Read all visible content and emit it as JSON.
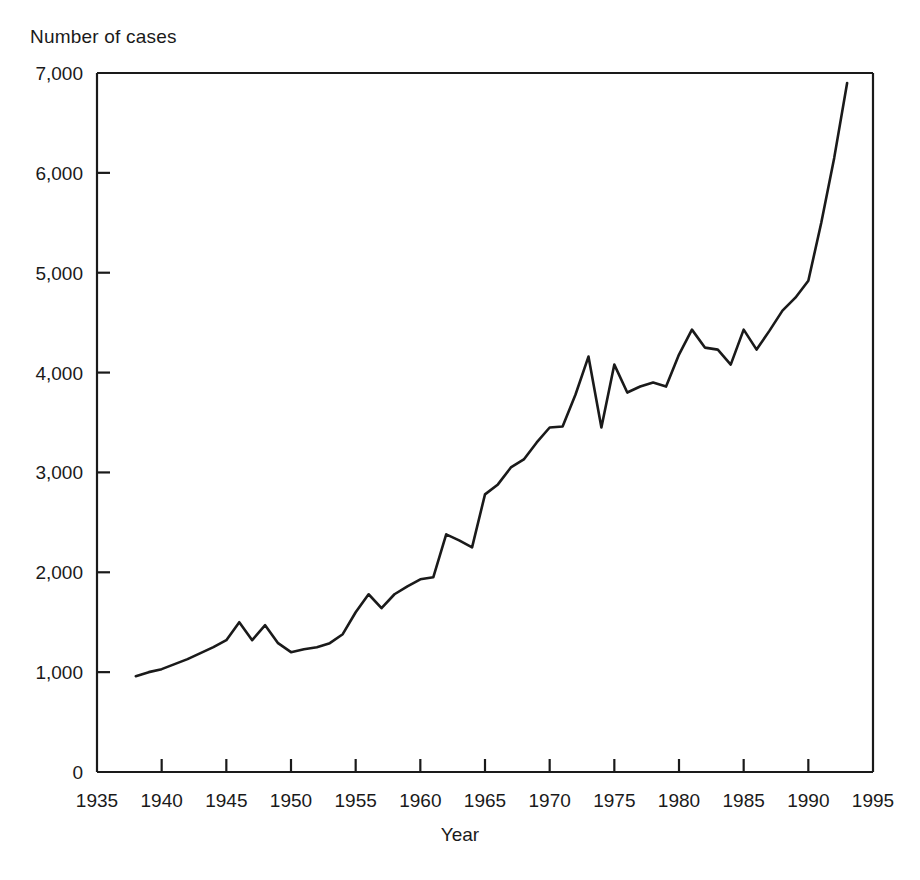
{
  "chart_data": {
    "type": "line",
    "title": "",
    "ylabel": "Number of cases",
    "xlabel": "Year",
    "xlim": [
      1935,
      1995
    ],
    "ylim": [
      0,
      7000
    ],
    "xticks": [
      1935,
      1940,
      1945,
      1950,
      1955,
      1960,
      1965,
      1970,
      1975,
      1980,
      1985,
      1990,
      1995
    ],
    "xtick_labels": [
      "1935",
      "1940",
      "1945",
      "1950",
      "1955",
      "1960",
      "1965",
      "1970",
      "1975",
      "1980",
      "1985",
      "1990",
      "1995"
    ],
    "yticks": [
      0,
      1000,
      2000,
      3000,
      4000,
      5000,
      6000,
      7000
    ],
    "ytick_labels": [
      "0",
      "1,000",
      "2,000",
      "3,000",
      "4,000",
      "5,000",
      "6,000",
      "7,000"
    ],
    "grid": false,
    "legend": false,
    "line_color": "#1a1a1a",
    "x": [
      1938,
      1939,
      1940,
      1941,
      1942,
      1943,
      1944,
      1945,
      1946,
      1947,
      1948,
      1949,
      1950,
      1951,
      1952,
      1953,
      1954,
      1955,
      1956,
      1957,
      1958,
      1959,
      1960,
      1961,
      1962,
      1963,
      1964,
      1965,
      1966,
      1967,
      1968,
      1969,
      1970,
      1971,
      1972,
      1973,
      1974,
      1975,
      1976,
      1977,
      1978,
      1979,
      1980,
      1981,
      1982,
      1983,
      1984,
      1985,
      1986,
      1987,
      1988,
      1989,
      1990,
      1991,
      1992,
      1993
    ],
    "values": [
      960,
      1000,
      1030,
      1080,
      1130,
      1190,
      1250,
      1320,
      1500,
      1320,
      1470,
      1290,
      1200,
      1230,
      1250,
      1290,
      1380,
      1600,
      1780,
      1640,
      1780,
      1860,
      1930,
      1950,
      2380,
      2320,
      2250,
      2780,
      2880,
      3050,
      3130,
      3300,
      3450,
      3460,
      3780,
      4160,
      3450,
      4080,
      3800,
      3860,
      3900,
      3860,
      4180,
      4430,
      4250,
      4230,
      4080,
      4430,
      4230,
      4420,
      4620,
      4750,
      4920,
      5500,
      6150,
      6900
    ],
    "series_name": "Number of cases"
  }
}
